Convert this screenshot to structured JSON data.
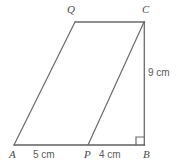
{
  "figure": {
    "type": "geometry-diagram",
    "background_color": "#ffffff",
    "stroke_color": "#6a6a6a",
    "stroke_color_dark": "#4f4f4f",
    "label_color": "#4a4a4a",
    "measure_color": "#5a5a5a",
    "vertices": [
      {
        "id": "Q",
        "label": "Q",
        "x": 75,
        "y": 22
      },
      {
        "id": "C",
        "label": "C",
        "x": 144,
        "y": 22
      },
      {
        "id": "A",
        "label": "A",
        "x": 14,
        "y": 145
      },
      {
        "id": "P",
        "label": "P",
        "x": 88,
        "y": 145
      },
      {
        "id": "B",
        "label": "B",
        "x": 144,
        "y": 145
      }
    ],
    "segments": [
      {
        "id": "AQ",
        "from": "A",
        "to": "Q",
        "x1": 14,
        "y1": 145,
        "x2": 75,
        "y2": 22
      },
      {
        "id": "QC",
        "from": "Q",
        "to": "C",
        "x1": 75,
        "y1": 22,
        "x2": 144,
        "y2": 22
      },
      {
        "id": "CB",
        "from": "C",
        "to": "B",
        "x1": 144,
        "y1": 22,
        "x2": 144,
        "y2": 145
      },
      {
        "id": "AB",
        "from": "A",
        "to": "B",
        "x1": 14,
        "y1": 145,
        "x2": 144,
        "y2": 145
      },
      {
        "id": "PC",
        "from": "P",
        "to": "C",
        "x1": 88,
        "y1": 145,
        "x2": 144,
        "y2": 22
      }
    ],
    "right_angle": {
      "at": "B",
      "size": 8,
      "x": 136,
      "y": 137
    },
    "measurements": [
      {
        "id": "AP",
        "label": "5 cm",
        "value": 5,
        "unit": "cm",
        "segment": "A-P"
      },
      {
        "id": "PB",
        "label": "4 cm",
        "value": 4,
        "unit": "cm",
        "segment": "P-B"
      },
      {
        "id": "CB",
        "label": "9 cm",
        "value": 9,
        "unit": "cm",
        "segment": "C-B"
      }
    ]
  }
}
